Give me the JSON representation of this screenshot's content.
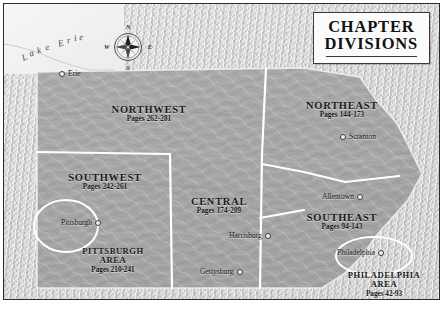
{
  "title": {
    "line1": "CHAPTER",
    "line2": "DIVISIONS"
  },
  "compass": {
    "north": "N",
    "south": "S",
    "east": "E",
    "west": "W",
    "icon": "compass-rose-icon"
  },
  "water": {
    "lake_label": "Lake Erie"
  },
  "regions": [
    {
      "key": "northwest",
      "name": "NORTHWEST",
      "pages": "Pages 262-281"
    },
    {
      "key": "northeast",
      "name": "NORTHEAST",
      "pages": "Pages 144-173"
    },
    {
      "key": "southwest",
      "name": "SOUTHWEST",
      "pages": "Pages 242-261"
    },
    {
      "key": "central",
      "name": "CENTRAL",
      "pages": "Pages 174-209"
    },
    {
      "key": "southeast",
      "name": "SOUTHEAST",
      "pages": "Pages 94-143"
    }
  ],
  "metro_areas": [
    {
      "key": "pittsburgh",
      "name1": "PITTSBURGH",
      "name2": "AREA",
      "pages": "Pages 210-241"
    },
    {
      "key": "philadelphia",
      "name1": "PHILADELPHIA",
      "name2": "AREA",
      "pages": "Pages 42-93"
    }
  ],
  "cities": [
    {
      "key": "erie",
      "name": "Erie"
    },
    {
      "key": "scranton",
      "name": "Scranton"
    },
    {
      "key": "pittsburgh",
      "name": "Pittsburgh"
    },
    {
      "key": "allentown",
      "name": "Allentown"
    },
    {
      "key": "harrisburg",
      "name": "Harrisburg"
    },
    {
      "key": "gettysburg",
      "name": "Gettysburg"
    },
    {
      "key": "philadelphia",
      "name": "Philadelphia"
    }
  ],
  "colors": {
    "state_fill": "#a8a8a8",
    "background": "#d9d9d9",
    "water": "#f2f2f2",
    "boundary": "#ffffff",
    "frame": "#2b2b2b",
    "text": "#1a1a1a"
  }
}
